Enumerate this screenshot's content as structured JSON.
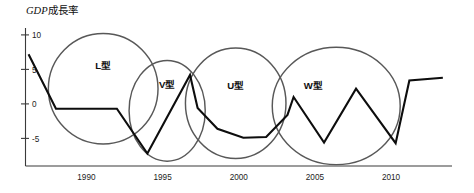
{
  "chart_data": {
    "type": "line",
    "title": "GDP成長率",
    "title_latin": "GDP",
    "title_cjk": "成長率",
    "xlabel": "",
    "ylabel": "",
    "xlim": [
      1986,
      2014
    ],
    "ylim": [
      -9,
      11
    ],
    "grid": false,
    "legend": "none",
    "yticks": [
      {
        "value": 10,
        "label": "10"
      },
      {
        "value": 5,
        "label": "5"
      },
      {
        "value": 0,
        "label": "0"
      },
      {
        "value": -5,
        "label": "-5"
      }
    ],
    "xticks": [
      {
        "value": 1990,
        "label": "1990"
      },
      {
        "value": 1995,
        "label": "1995"
      },
      {
        "value": 2000,
        "label": "2000"
      },
      {
        "value": 2005,
        "label": "2005"
      },
      {
        "value": 2010,
        "label": "2010"
      }
    ],
    "series": [
      {
        "name": "GDP成長率",
        "color": "#0d0d0d",
        "points": [
          {
            "x": 1986.2,
            "y": 7.2
          },
          {
            "x": 1988.0,
            "y": -0.7
          },
          {
            "x": 1992.0,
            "y": -0.7
          },
          {
            "x": 1994.0,
            "y": -7.2
          },
          {
            "x": 1996.8,
            "y": 4.2
          },
          {
            "x": 1997.3,
            "y": -0.6
          },
          {
            "x": 1998.6,
            "y": -3.6
          },
          {
            "x": 2000.3,
            "y": -4.9
          },
          {
            "x": 2001.8,
            "y": -4.8
          },
          {
            "x": 2003.2,
            "y": -1.6
          },
          {
            "x": 2003.6,
            "y": 1.0
          },
          {
            "x": 2005.6,
            "y": -5.6
          },
          {
            "x": 2007.7,
            "y": 2.2
          },
          {
            "x": 2010.3,
            "y": -5.7
          },
          {
            "x": 2011.2,
            "y": 3.4
          },
          {
            "x": 2013.4,
            "y": 3.8
          }
        ]
      }
    ],
    "annotations": [
      {
        "id": "L",
        "label": "L型",
        "label_x": 1991.1,
        "label_y": 5.1,
        "shape": "ellipse",
        "cx": 1991.1,
        "cy": 2.2,
        "rx": 3.6,
        "ry": 8.0
      },
      {
        "id": "V",
        "label": "V型",
        "label_x": 1995.3,
        "label_y": 2.3,
        "shape": "ellipse",
        "cx": 1995.3,
        "cy": -1.0,
        "rx": 2.5,
        "ry": 7.3
      },
      {
        "id": "U",
        "label": "U型",
        "label_x": 1999.8,
        "label_y": 2.1,
        "shape": "ellipse",
        "cx": 1999.8,
        "cy": 0.1,
        "rx": 3.3,
        "ry": 8.0
      },
      {
        "id": "W",
        "label": "W型",
        "label_x": 2004.9,
        "label_y": 2.1,
        "shape": "ellipse",
        "cx": 2006.4,
        "cy": -0.3,
        "rx": 4.2,
        "ry": 8.5
      }
    ]
  },
  "colors": {
    "line": "#0d0d0d",
    "circle": "#585858",
    "axis": "#3a3a3a",
    "text": "#1c1c1c",
    "background": "#ffffff"
  }
}
